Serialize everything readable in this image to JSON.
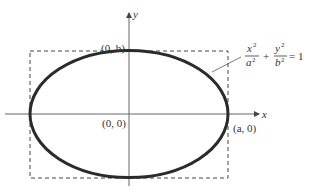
{
  "diagram": {
    "type": "ellipse-on-axes",
    "colors": {
      "background": "#ffffff",
      "axes": "#555555",
      "ellipse": "#2b2b2b",
      "dashed_box": "#444444",
      "text": "#333333"
    },
    "axes": {
      "x_label": "x",
      "y_label": "y"
    },
    "points": {
      "top": "(0, b)",
      "origin": "(0, 0)",
      "right": "(a, 0)"
    },
    "equation": {
      "term1_num": "x",
      "term1_num_exp": "2",
      "term1_den": "a",
      "term1_den_exp": "2",
      "plus": "+",
      "term2_num": "y",
      "term2_num_exp": "2",
      "term2_den": "b",
      "term2_den_exp": "2",
      "rhs": "= 1"
    }
  }
}
